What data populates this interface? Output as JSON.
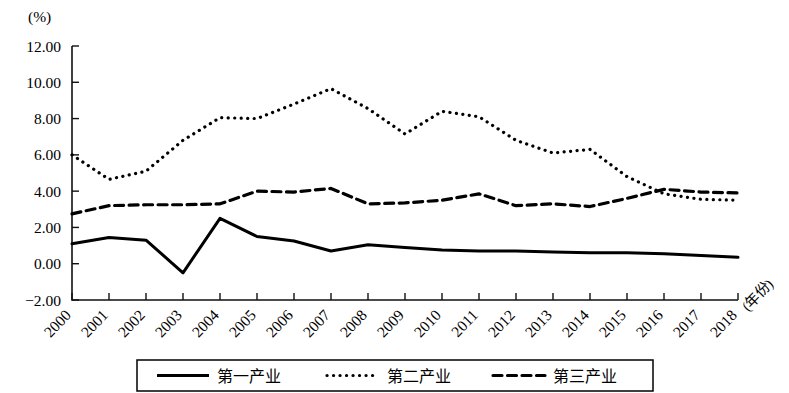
{
  "chart_data": {
    "type": "line",
    "title": "",
    "subtitle": "",
    "xlabel": "(年份)",
    "ylabel": "(%)",
    "ylim": [
      -2.0,
      12.0
    ],
    "ytick_step": 2.0,
    "ytick_labels": [
      "12.00",
      "10.00",
      "8.00",
      "6.00",
      "4.00",
      "2.00",
      "0.00",
      "-2.00"
    ],
    "ytick_values": [
      12.0,
      10.0,
      8.0,
      6.0,
      4.0,
      2.0,
      0.0,
      -2.0
    ],
    "grid": false,
    "legend_position": "bottom",
    "categories": [
      "2000",
      "2001",
      "2002",
      "2003",
      "2004",
      "2005",
      "2006",
      "2007",
      "2008",
      "2009",
      "2010",
      "2011",
      "2012",
      "2013",
      "2014",
      "2015",
      "2016",
      "2017",
      "2018"
    ],
    "x": [
      2000,
      2001,
      2002,
      2003,
      2004,
      2005,
      2006,
      2007,
      2008,
      2009,
      2010,
      2011,
      2012,
      2013,
      2014,
      2015,
      2016,
      2017,
      2018
    ],
    "series": [
      {
        "name": "第一产业",
        "style": "solid",
        "color": "#000000",
        "values": [
          1.1,
          1.45,
          1.3,
          -0.5,
          2.5,
          1.5,
          1.25,
          0.7,
          1.05,
          0.9,
          0.75,
          0.7,
          0.7,
          0.65,
          0.6,
          0.6,
          0.55,
          0.45,
          0.35
        ]
      },
      {
        "name": "第二产业",
        "style": "dotted",
        "color": "#000000",
        "values": [
          6.0,
          4.65,
          5.1,
          6.8,
          8.05,
          8.0,
          8.8,
          9.65,
          8.55,
          7.15,
          8.4,
          8.1,
          6.8,
          6.1,
          6.3,
          4.8,
          3.85,
          3.55,
          3.5
        ]
      },
      {
        "name": "第三产业",
        "style": "dashed",
        "color": "#000000",
        "values": [
          2.75,
          3.2,
          3.25,
          3.25,
          3.3,
          4.0,
          3.95,
          4.15,
          3.3,
          3.35,
          3.5,
          3.85,
          3.2,
          3.3,
          3.15,
          3.6,
          4.1,
          3.95,
          3.9
        ]
      }
    ]
  },
  "axes": {
    "y_unit_label": "(%)",
    "x_axis_label": "(年份)"
  },
  "legend": {
    "items": [
      {
        "label": "第一产业",
        "style": "solid"
      },
      {
        "label": "第二产业",
        "style": "dotted"
      },
      {
        "label": "第三产业",
        "style": "dashed"
      }
    ]
  }
}
